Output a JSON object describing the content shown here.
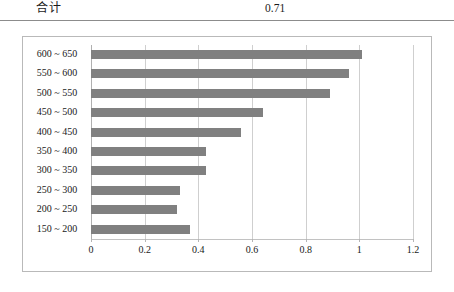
{
  "summary": {
    "label": "合计",
    "value": "0.71"
  },
  "chart_data": {
    "type": "bar",
    "orientation": "horizontal",
    "title": "",
    "xlabel": "",
    "ylabel": "",
    "categories": [
      "600 ~ 650",
      "550 ~ 600",
      "500 ~ 550",
      "450 ~ 500",
      "400 ~ 450",
      "350 ~ 400",
      "300 ~ 350",
      "250 ~ 300",
      "200 ~ 250",
      "150 ~ 200"
    ],
    "values": [
      1.01,
      0.96,
      0.89,
      0.64,
      0.56,
      0.43,
      0.43,
      0.33,
      0.32,
      0.37
    ],
    "xlim": [
      0,
      1.2
    ],
    "xticks": [
      0,
      0.2,
      0.4,
      0.6,
      0.8,
      1,
      1.2
    ],
    "xtick_labels": [
      "0",
      "0.2",
      "0.4",
      "0.6",
      "0.8",
      "1",
      "1.2"
    ],
    "grid": true,
    "legend": false,
    "bar_color": "#808080",
    "grid_color": "#cfcfcf",
    "frame_color": "#b9b9b9"
  }
}
